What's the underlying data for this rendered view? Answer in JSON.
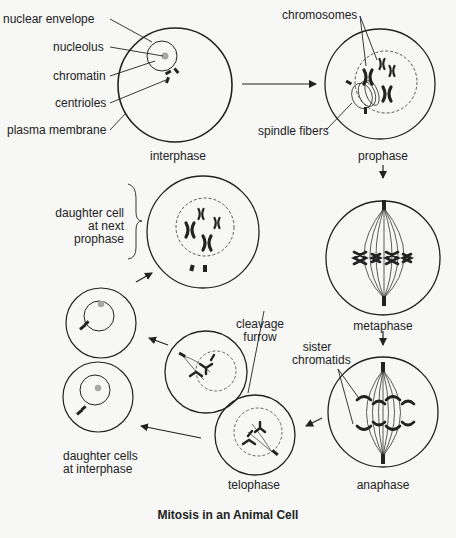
{
  "diagram": {
    "title": "Mitosis in an Animal Cell",
    "stages": {
      "interphase": "interphase",
      "prophase": "prophase",
      "metaphase": "metaphase",
      "anaphase": "anaphase",
      "telophase": "telophase",
      "daughter_next_prophase": [
        "daughter cell",
        "at next",
        "prophase"
      ],
      "daughter_interphase": [
        "daughter cells",
        "at interphase"
      ]
    },
    "labels": {
      "nuclear_envelope": "nuclear envelope",
      "nucleolus": "nucleolus",
      "chromatin": "chromatin",
      "centrioles": "centrioles",
      "plasma_membrane": "plasma membrane",
      "chromosomes": "chromosomes",
      "spindle_fibers": "spindle fibers",
      "sister_chromatids": [
        "sister",
        "chromatids"
      ],
      "cleavage_furrow": [
        "cleavage",
        "furrow"
      ]
    },
    "colors": {
      "line": "#222222",
      "nucleolus": "#a6a6a6",
      "background": "#f7f7f6"
    }
  }
}
